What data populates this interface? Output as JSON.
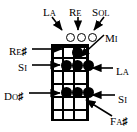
{
  "diagram": {
    "kind": "chord-diagram",
    "instrument_strings": 4,
    "frets": 6,
    "top_labels": [
      {
        "id": "la-top",
        "text": "La",
        "cap": "L",
        "rest": "A"
      },
      {
        "id": "re-top",
        "text": "Re",
        "cap": "R",
        "rest": "E"
      },
      {
        "id": "sol-top",
        "text": "Sol",
        "cap": "S",
        "rest": "OL"
      }
    ],
    "left_labels": [
      {
        "id": "re-sharp",
        "cap": "R",
        "rest": "E",
        "accidental": "♯"
      },
      {
        "id": "si-left",
        "cap": "S",
        "rest": "I",
        "accidental": ""
      },
      {
        "id": "do-sharp",
        "cap": "D",
        "rest": "O",
        "accidental": "♯"
      }
    ],
    "right_labels": [
      {
        "id": "mi",
        "cap": "M",
        "rest": "I",
        "accidental": ""
      },
      {
        "id": "la-right",
        "cap": "L",
        "rest": "A",
        "accidental": ""
      },
      {
        "id": "si-right",
        "cap": "S",
        "rest": "I",
        "accidental": ""
      },
      {
        "id": "fa-sharp",
        "cap": "F",
        "rest": "A",
        "accidental": "♯"
      }
    ],
    "open_strings": [
      {
        "string": 2,
        "marker": "o"
      },
      {
        "string": 3,
        "marker": "o"
      },
      {
        "string": 4,
        "marker": "o"
      }
    ],
    "dots": [
      {
        "string": 2,
        "fret": 1
      },
      {
        "string": 1,
        "fret": 2
      },
      {
        "string": 2,
        "fret": 2
      },
      {
        "string": 3,
        "fret": 2
      },
      {
        "string": 1,
        "fret": 4
      },
      {
        "string": 2,
        "fret": 4
      },
      {
        "string": 3,
        "fret": 4
      }
    ],
    "colors": {
      "ink": "#000000",
      "paper": "#ffffff"
    }
  }
}
